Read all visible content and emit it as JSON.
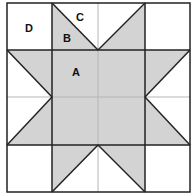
{
  "diagram": {
    "colors": {
      "fill": "#d3d3d3",
      "background": "#ffffff",
      "line": "#222222",
      "faint_line": "#b5b5b5"
    },
    "grid": {
      "rows": 4,
      "cols": 4
    },
    "labels": [
      {
        "id": "A",
        "text": "A",
        "x": 76,
        "y": 76
      },
      {
        "id": "B",
        "text": "B",
        "x": 63,
        "y": 42
      },
      {
        "id": "C",
        "text": "C",
        "x": 76,
        "y": 20
      },
      {
        "id": "D",
        "text": "D",
        "x": 25,
        "y": 32
      }
    ]
  }
}
